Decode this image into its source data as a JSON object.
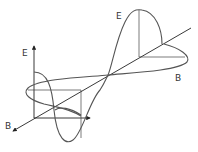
{
  "diagram": {
    "type": "electromagnetic-wave",
    "labels": {
      "e_top": "E",
      "b_right": "B",
      "e_axis": "E",
      "b_axis": "B"
    },
    "colors": {
      "stroke": "#555555",
      "axis": "#222222",
      "background": "#ffffff"
    }
  }
}
